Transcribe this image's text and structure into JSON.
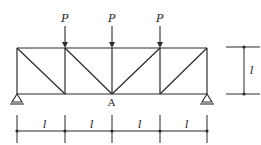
{
  "diagram": {
    "type": "truss",
    "colors": {
      "line": "#2a2a2a",
      "background": "#ffffff"
    },
    "loads": [
      {
        "label": "P",
        "x": 65
      },
      {
        "label": "P",
        "x": 112
      },
      {
        "label": "P",
        "x": 160
      }
    ],
    "node_label": "A",
    "height_label": "l",
    "panel_labels": [
      "l",
      "l",
      "l",
      "l"
    ]
  }
}
